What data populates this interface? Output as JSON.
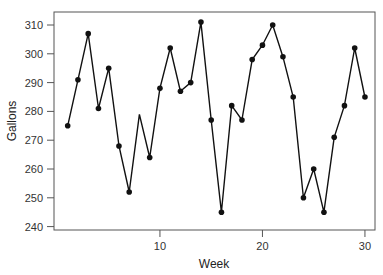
{
  "chart_data": {
    "type": "line",
    "title": "",
    "xlabel": "Week",
    "ylabel": "Gallons",
    "xlim": [
      0,
      31
    ],
    "ylim": [
      239,
      312
    ],
    "xticks": [
      10,
      20,
      30
    ],
    "yticks": [
      240,
      250,
      260,
      270,
      280,
      290,
      300,
      310
    ],
    "grid": false,
    "legend": null,
    "x": [
      1,
      2,
      3,
      4,
      5,
      6,
      7,
      8,
      9,
      10,
      11,
      12,
      13,
      14,
      15,
      16,
      17,
      18,
      19,
      20,
      21,
      22,
      23,
      24,
      25,
      26,
      27,
      28,
      29,
      30
    ],
    "series": [
      {
        "name": "Gallons",
        "values": [
          275,
          291,
          307,
          281,
          295,
          268,
          252,
          279,
          264,
          288,
          302,
          287,
          290,
          311,
          277,
          245,
          282,
          277,
          298,
          303,
          310,
          299,
          285,
          250,
          260,
          245,
          271,
          282,
          302,
          285
        ],
        "markers": [
          true,
          true,
          true,
          true,
          true,
          true,
          true,
          false,
          true,
          true,
          true,
          true,
          true,
          true,
          true,
          true,
          true,
          true,
          true,
          true,
          true,
          true,
          true,
          true,
          true,
          true,
          true,
          true,
          true,
          true
        ],
        "color": "#111111"
      }
    ]
  }
}
